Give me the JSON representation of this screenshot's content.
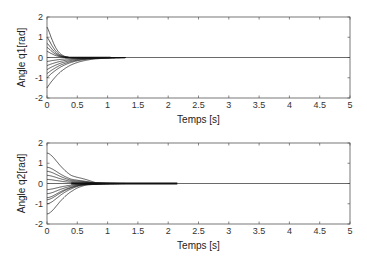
{
  "chart_data": [
    {
      "type": "line",
      "title": "",
      "xlabel": "Temps [s]",
      "ylabel": "Angle q1[rad]",
      "xlim": [
        0,
        5
      ],
      "ylim": [
        -2,
        2
      ],
      "xticks": [
        "0",
        "0.5",
        "1",
        "1.5",
        "2",
        "2.5",
        "3",
        "3.5",
        "4",
        "4.5",
        "5"
      ],
      "yticks": [
        "-2",
        "-1",
        "0",
        "1",
        "2"
      ],
      "grid": false,
      "legend": null,
      "series_description": "Multiple trajectories converging to 0 from different initial conditions",
      "initial_values": [
        1.5,
        1.0,
        0.7,
        0.5,
        0.3,
        -0.2,
        -0.4,
        -0.6,
        -0.8,
        -1.0,
        -1.5
      ],
      "settling_time_approx": 1.0
    },
    {
      "type": "line",
      "title": "",
      "xlabel": "Temps [s]",
      "ylabel": "Angle q2[rad]",
      "xlim": [
        0,
        5
      ],
      "ylim": [
        -2,
        2
      ],
      "xticks": [
        "0",
        "0.5",
        "1",
        "1.5",
        "2",
        "2.5",
        "3",
        "3.5",
        "4",
        "4.5",
        "5"
      ],
      "yticks": [
        "-2",
        "-1",
        "0",
        "1",
        "2"
      ],
      "grid": false,
      "legend": null,
      "series_description": "Multiple trajectories converging to 0 from different initial conditions, slight overshoot near t=0.6s",
      "initial_values": [
        1.5,
        0.8,
        0.6,
        0.4,
        0.2,
        -0.3,
        -0.5,
        -0.7,
        -0.8,
        -1.0,
        -1.5
      ],
      "settling_time_approx": 0.8,
      "bold_segment_end": 2.15
    }
  ],
  "plots": [
    {
      "ylabel": "Angle q1[rad]",
      "xlabel": "Temps [s]"
    },
    {
      "ylabel": "Angle q2[rad]",
      "xlabel": "Temps [s]"
    }
  ],
  "colors": {
    "axis": "#555555",
    "curve": "#111111",
    "zero_line": "#444444"
  }
}
